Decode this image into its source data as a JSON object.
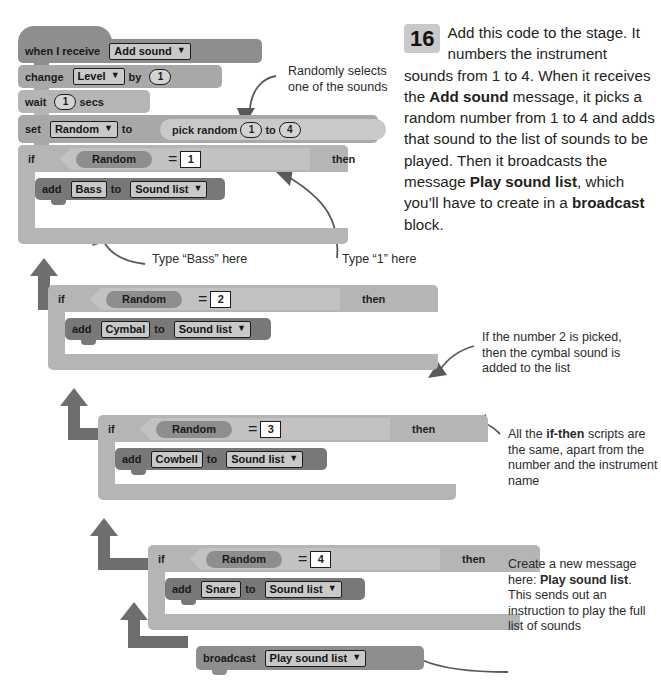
{
  "step": {
    "number": "16",
    "paragraph_html": "Add this code to the stage. It numbers the instrument sounds from 1 to 4. When it receives the <b>Add sound</b> message, it picks a random number from 1 to 4 and adds that sound to the list of sounds to be played. Then it broadcasts the message <b>Play sound list</b>, which you’ll have to create in a <b>broadcast</b> block."
  },
  "script": {
    "hat": {
      "label": "when I receive",
      "message": "Add sound",
      "caret": "▼"
    },
    "change_var": {
      "label": "change",
      "variable": "Level",
      "caret": "▼",
      "by_label": "by",
      "value": "1"
    },
    "wait": {
      "label": "wait",
      "value": "1",
      "unit": "secs"
    },
    "set_var": {
      "label": "set",
      "variable": "Random",
      "caret": "▼",
      "to_label": "to"
    },
    "pick_random": {
      "label": "pick random",
      "from": "1",
      "to_label": "to",
      "to": "4"
    },
    "ifs": [
      {
        "if_label": "if",
        "variable": "Random",
        "op": "=",
        "number": "1",
        "then_label": "then",
        "add_label": "add",
        "instrument": "Bass",
        "to_label": "to",
        "list": "Sound list",
        "caret": "▼"
      },
      {
        "if_label": "if",
        "variable": "Random",
        "op": "=",
        "number": "2",
        "then_label": "then",
        "add_label": "add",
        "instrument": "Cymbal",
        "to_label": "to",
        "list": "Sound list",
        "caret": "▼"
      },
      {
        "if_label": "if",
        "variable": "Random",
        "op": "=",
        "number": "3",
        "then_label": "then",
        "add_label": "add",
        "instrument": "Cowbell",
        "to_label": "to",
        "list": "Sound list",
        "caret": "▼"
      },
      {
        "if_label": "if",
        "variable": "Random",
        "op": "=",
        "number": "4",
        "then_label": "then",
        "add_label": "add",
        "instrument": "Snare",
        "to_label": "to",
        "list": "Sound list",
        "caret": "▼"
      }
    ],
    "broadcast": {
      "label": "broadcast",
      "message": "Play sound list",
      "caret": "▼"
    }
  },
  "notes": {
    "random_select": "Randomly selects\none of the sounds",
    "type_bass": "Type “Bass” here",
    "type_one": "Type “1” here",
    "cymbal_note": "If the number 2 is picked,\nthen the cymbal sound is\nadded to the list",
    "ifthen_note_html": "All the <b>if-then</b> scripts are the same, apart from the number and the instrument name",
    "broadcast_note_html": "Create a new message here: <b>Play sound list</b>. This sends out an instruction to play the full list of sounds"
  },
  "colors": {
    "event": "#8e8e8e",
    "data": "#a8a8a8",
    "data_dark": "#787878",
    "control": "#b5b5b5",
    "control_light": "#c2c2c2",
    "operator": "#c9c9c9",
    "variable": "#9a9a9a",
    "text": "#231f20",
    "arrow": "#6e6e6e"
  }
}
